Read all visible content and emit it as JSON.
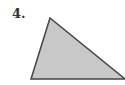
{
  "problem": {
    "number_label": "4."
  },
  "figure": {
    "shape": "triangle",
    "fill": "#c8c8c8",
    "stroke": "#444444",
    "vertices": [
      [
        50,
        18
      ],
      [
        31,
        79
      ],
      [
        125,
        79
      ]
    ]
  }
}
